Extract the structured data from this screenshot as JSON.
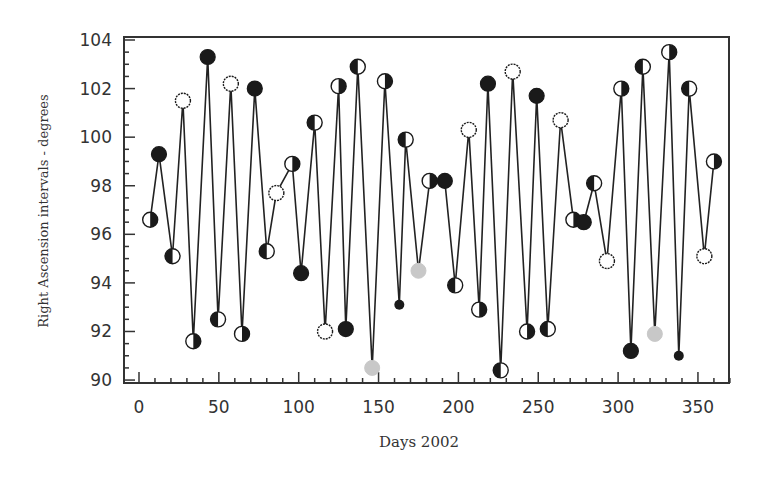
{
  "chart_data": {
    "type": "line",
    "title": "",
    "xlabel": "Days 2002",
    "ylabel": "Right Ascension intervals - degrees",
    "xlim": [
      -10,
      370
    ],
    "ylim": [
      90,
      104
    ],
    "xticks": [
      0,
      50,
      100,
      150,
      200,
      250,
      300,
      350
    ],
    "yticks": [
      90,
      92,
      94,
      96,
      98,
      100,
      102,
      104
    ],
    "grid": false,
    "legend": null,
    "marker_types": {
      "full": "filled dark circle",
      "new": "open circle",
      "half_left": "left half dark",
      "half_right": "right half dark",
      "gray": "light gray filled",
      "small_dark": "small dark dot"
    },
    "series": [
      {
        "name": "RA intervals",
        "points": [
          {
            "x": 7,
            "y": 96.6,
            "m": "half_right"
          },
          {
            "x": 12.5,
            "y": 99.3,
            "m": "full"
          },
          {
            "x": 21,
            "y": 95.1,
            "m": "half_left"
          },
          {
            "x": 27.5,
            "y": 101.5,
            "m": "new"
          },
          {
            "x": 34,
            "y": 91.6,
            "m": "half_right"
          },
          {
            "x": 43,
            "y": 103.3,
            "m": "full"
          },
          {
            "x": 49.5,
            "y": 92.5,
            "m": "half_left"
          },
          {
            "x": 57.5,
            "y": 102.2,
            "m": "new"
          },
          {
            "x": 64.5,
            "y": 91.9,
            "m": "half_right"
          },
          {
            "x": 72.5,
            "y": 102.0,
            "m": "full"
          },
          {
            "x": 80,
            "y": 95.3,
            "m": "half_left"
          },
          {
            "x": 86,
            "y": 97.7,
            "m": "new"
          },
          {
            "x": 96,
            "y": 98.9,
            "m": "half_right"
          },
          {
            "x": 101.5,
            "y": 94.4,
            "m": "full"
          },
          {
            "x": 110,
            "y": 100.6,
            "m": "half_left"
          },
          {
            "x": 116.5,
            "y": 92.0,
            "m": "new"
          },
          {
            "x": 125,
            "y": 102.1,
            "m": "half_right"
          },
          {
            "x": 129.5,
            "y": 92.1,
            "m": "full"
          },
          {
            "x": 137,
            "y": 102.9,
            "m": "half_left"
          },
          {
            "x": 146,
            "y": 90.5,
            "m": "gray"
          },
          {
            "x": 154,
            "y": 102.3,
            "m": "half_right"
          },
          {
            "x": 163,
            "y": 93.1,
            "m": "small_dark"
          },
          {
            "x": 167,
            "y": 99.9,
            "m": "half_left"
          },
          {
            "x": 175,
            "y": 94.5,
            "m": "gray"
          },
          {
            "x": 182,
            "y": 98.2,
            "m": "half_right"
          },
          {
            "x": 191.5,
            "y": 98.2,
            "m": "full"
          },
          {
            "x": 198,
            "y": 93.9,
            "m": "half_left"
          },
          {
            "x": 206.5,
            "y": 100.3,
            "m": "new"
          },
          {
            "x": 213,
            "y": 92.9,
            "m": "half_right"
          },
          {
            "x": 218.5,
            "y": 102.2,
            "m": "full"
          },
          {
            "x": 226.5,
            "y": 90.4,
            "m": "half_left"
          },
          {
            "x": 234,
            "y": 102.7,
            "m": "new"
          },
          {
            "x": 243,
            "y": 92.0,
            "m": "half_right"
          },
          {
            "x": 249,
            "y": 101.7,
            "m": "full"
          },
          {
            "x": 256,
            "y": 92.1,
            "m": "half_left"
          },
          {
            "x": 264,
            "y": 100.7,
            "m": "new"
          },
          {
            "x": 272,
            "y": 96.6,
            "m": "half_right"
          },
          {
            "x": 278.5,
            "y": 96.5,
            "m": "full"
          },
          {
            "x": 285,
            "y": 98.1,
            "m": "half_left"
          },
          {
            "x": 293,
            "y": 94.9,
            "m": "new"
          },
          {
            "x": 302,
            "y": 102.0,
            "m": "half_right"
          },
          {
            "x": 308,
            "y": 91.2,
            "m": "full"
          },
          {
            "x": 315.5,
            "y": 102.9,
            "m": "half_left"
          },
          {
            "x": 323,
            "y": 91.9,
            "m": "gray"
          },
          {
            "x": 332,
            "y": 103.5,
            "m": "half_right"
          },
          {
            "x": 338,
            "y": 91.0,
            "m": "small_dark"
          },
          {
            "x": 344.5,
            "y": 102.0,
            "m": "half_left"
          },
          {
            "x": 354,
            "y": 95.1,
            "m": "new"
          },
          {
            "x": 360,
            "y": 99.0,
            "m": "half_right"
          }
        ]
      }
    ]
  },
  "colors": {
    "line": "#222222",
    "marker_dark": "#1a1a1a",
    "marker_gray": "#c8c8c8",
    "frame": "#333333",
    "background": "#ffffff"
  }
}
